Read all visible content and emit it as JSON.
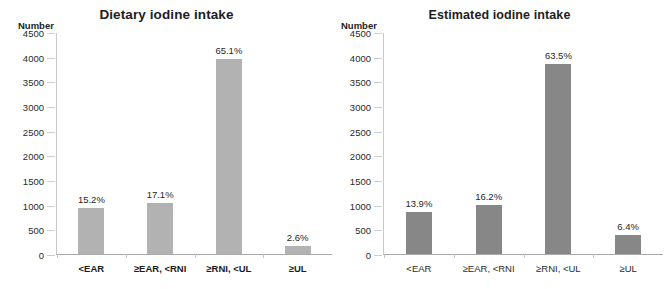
{
  "chart_data": [
    {
      "type": "bar",
      "title": "Dietary iodine intake",
      "xlabel": "",
      "ylabel": "Number",
      "ylim": [
        0,
        4500
      ],
      "grid": false,
      "legend": "none",
      "bar_color": "#b2b2b2",
      "categories": [
        "<EAR",
        "≥EAR, <RNI",
        "≥RNI, <UL",
        "≥UL"
      ],
      "values": [
        925,
        1040,
        3960,
        158
      ],
      "data_labels": [
        "15.2%",
        "17.1%",
        "65.1%",
        "2.6%"
      ],
      "tick_labels": [
        "4500",
        "4000",
        "3500",
        "3000",
        "2500",
        "2000",
        "1500",
        "1000",
        "500",
        "0"
      ],
      "tick_values": [
        4500,
        4000,
        3500,
        3000,
        2500,
        2000,
        1500,
        1000,
        500,
        0
      ]
    },
    {
      "type": "bar",
      "title": "Estimated iodine intake",
      "xlabel": "",
      "ylabel": "Number",
      "ylim": [
        0,
        4500
      ],
      "grid": false,
      "legend": "none",
      "bar_color": "#878787",
      "categories": [
        "<EAR",
        "≥EAR, <RNI",
        "≥RNI, <UL",
        "≥UL"
      ],
      "values": [
        845,
        985,
        3860,
        390
      ],
      "data_labels": [
        "13.9%",
        "16.2%",
        "63.5%",
        "6.4%"
      ],
      "tick_labels": [
        "4500",
        "4000",
        "3500",
        "3000",
        "2500",
        "2000",
        "1500",
        "1000",
        "500",
        "0"
      ],
      "tick_values": [
        4500,
        4000,
        3500,
        3000,
        2500,
        2000,
        1500,
        1000,
        500,
        0
      ]
    }
  ]
}
